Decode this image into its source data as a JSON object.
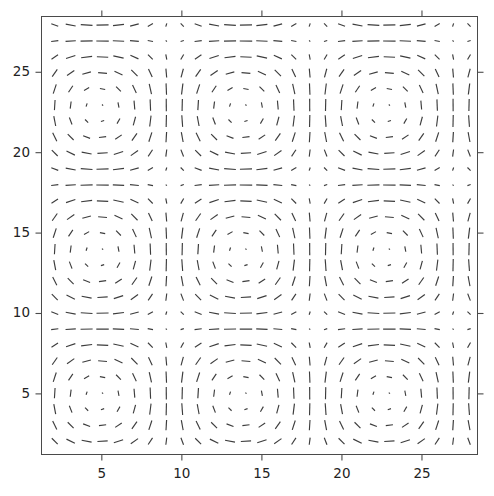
{
  "figure": {
    "width": 494,
    "height": 496,
    "background_color": "#ffffff",
    "axes_color": "#4a4a4a",
    "arrow_color": "#3c3c3c"
  },
  "chart_data": {
    "type": "quiver",
    "title": "",
    "xlabel": "",
    "ylabel": "",
    "xlim": [
      1.2,
      28.5
    ],
    "ylim": [
      1.2,
      28.5
    ],
    "grid": false,
    "legend": null,
    "xticks": [
      5,
      10,
      15,
      20,
      25
    ],
    "yticks": [
      5,
      10,
      15,
      20,
      25
    ],
    "xtick_labels": [
      "5",
      "10",
      "15",
      "20",
      "25"
    ],
    "ytick_labels": [
      "5",
      "10",
      "15",
      "20",
      "25"
    ],
    "grid_nx": 28,
    "grid_ny": 28,
    "grid_x_start": 1,
    "grid_y_start": 1,
    "grid_step": 1,
    "field_model": {
      "u_formula": "sin(pi*x/9.0)*cos(pi*y/9.0)",
      "v_formula": "-cos(pi*x/9.0)*sin(pi*y/9.0)",
      "period_x": 18.0,
      "period_y": 18.0,
      "phase_x": 0.25,
      "phase_y": 0.25,
      "arrow_scale_px": 12.6,
      "max_magnitude": 1.0
    },
    "vortex_centers": [
      {
        "x": 4.75,
        "y": 4.75,
        "sense": "counterclockwise"
      },
      {
        "x": 13.75,
        "y": 4.75,
        "sense": "clockwise"
      },
      {
        "x": 22.75,
        "y": 4.75,
        "sense": "counterclockwise"
      },
      {
        "x": 4.75,
        "y": 13.75,
        "sense": "clockwise"
      },
      {
        "x": 13.75,
        "y": 13.75,
        "sense": "counterclockwise"
      },
      {
        "x": 22.75,
        "y": 13.75,
        "sense": "clockwise"
      },
      {
        "x": 4.75,
        "y": 22.75,
        "sense": "counterclockwise"
      },
      {
        "x": 13.75,
        "y": 22.75,
        "sense": "clockwise"
      },
      {
        "x": 22.75,
        "y": 22.75,
        "sense": "counterclockwise"
      }
    ]
  }
}
